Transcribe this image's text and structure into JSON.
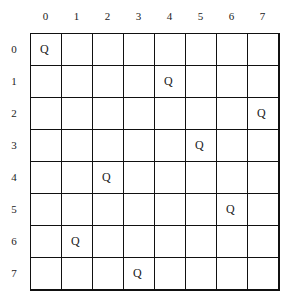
{
  "diagram": {
    "type": "n-queens-board",
    "size": 8,
    "column_labels": [
      "0",
      "1",
      "2",
      "3",
      "4",
      "5",
      "6",
      "7"
    ],
    "row_labels": [
      "0",
      "1",
      "2",
      "3",
      "4",
      "5",
      "6",
      "7"
    ],
    "queen_symbol": "Q",
    "queens": [
      {
        "row": 0,
        "col": 0
      },
      {
        "row": 1,
        "col": 4
      },
      {
        "row": 2,
        "col": 7
      },
      {
        "row": 3,
        "col": 5
      },
      {
        "row": 4,
        "col": 2
      },
      {
        "row": 5,
        "col": 6
      },
      {
        "row": 6,
        "col": 1
      },
      {
        "row": 7,
        "col": 3
      }
    ],
    "colors": {
      "line": "#111111",
      "background": "#ffffff",
      "text": "#222222"
    }
  }
}
